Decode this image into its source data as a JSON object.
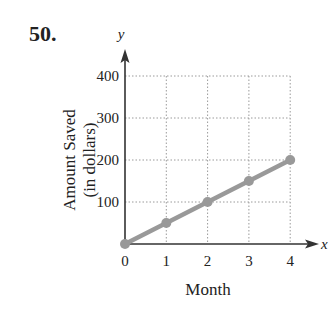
{
  "problem_number": "50.",
  "colors": {
    "axis": "#333333",
    "grid": "#9a9a9a",
    "series": "#999999"
  },
  "chart_data": {
    "type": "line",
    "title": "",
    "xlabel": "Month",
    "ylabel": "Amount Saved (in dollars)",
    "ylabel_lines": [
      "Amount Saved",
      "(in dollars)"
    ],
    "x_axis_var": "x",
    "y_axis_var": "y",
    "x": [
      0,
      1,
      2,
      3,
      4
    ],
    "values": [
      0,
      50,
      100,
      150,
      200
    ],
    "x_ticks": [
      "0",
      "1",
      "2",
      "3",
      "4"
    ],
    "y_ticks": [
      "100",
      "200",
      "300",
      "400"
    ],
    "xlim": [
      0,
      4
    ],
    "ylim": [
      0,
      400
    ],
    "grid": true,
    "grid_style": "dotted",
    "legend": null
  }
}
